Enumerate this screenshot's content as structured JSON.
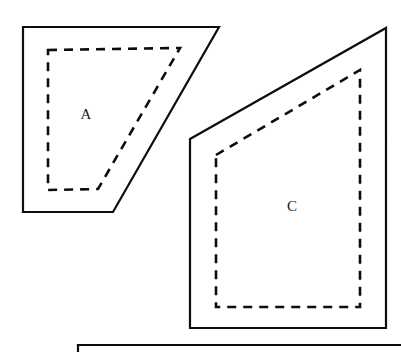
{
  "figure": {
    "canvas": {
      "width": 401,
      "height": 353
    },
    "background_color": "#ffffff",
    "stroke_color": "#0d0d0d",
    "label_color": "#1a1a1a",
    "shapes": [
      {
        "id": "shape-a",
        "label": "A",
        "label_x": 86,
        "label_y": 114,
        "outline_points": "23,27 219,27 113,212 23,212",
        "inner_points": "48,50 180,48 98,189 48,190",
        "outline_style": "solid",
        "inner_style": "dashed"
      },
      {
        "id": "shape-c",
        "label": "C",
        "label_x": 292,
        "label_y": 206,
        "outline_points": "190,139 386,28 386,328 190,328",
        "inner_points": "216,155 360,70 360,307 216,307",
        "outline_style": "solid",
        "inner_style": "dashed"
      }
    ],
    "partial_shape": {
      "id": "shape-partial-bottom",
      "description": "top edge of a third region cropped by the bottom of the frame",
      "points": "78,352 78,345 401,345"
    }
  }
}
